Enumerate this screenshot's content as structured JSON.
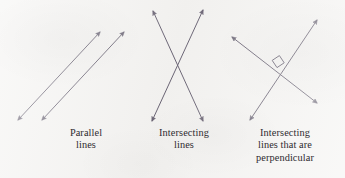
{
  "figure": {
    "background_color": "#f4f3f1",
    "stroke_color": "#6b6575",
    "text_color": "#2e2b30",
    "stroke_width": 1.0
  },
  "diagrams": [
    {
      "id": "parallel",
      "name": "parallel-lines",
      "caption": "Parallel\nlines",
      "caption_line1": "Parallel",
      "caption_line2": "lines",
      "arrow_style": "double-headed",
      "lines": [
        {
          "x1": 18,
          "y1": 120,
          "x2": 100,
          "y2": 32
        },
        {
          "x1": 42,
          "y1": 120,
          "x2": 124,
          "y2": 32
        }
      ],
      "has_right_angle_mark": false
    },
    {
      "id": "intersecting",
      "name": "intersecting-lines",
      "caption": "Intersecting\nlines",
      "caption_line1": "Intersecting",
      "caption_line2": "lines",
      "arrow_style": "double-headed",
      "lines": [
        {
          "x1": 153,
          "y1": 11,
          "x2": 203,
          "y2": 121
        },
        {
          "x1": 203,
          "y1": 10,
          "x2": 152,
          "y2": 121
        }
      ],
      "has_right_angle_mark": false
    },
    {
      "id": "perpendicular",
      "name": "perpendicular-intersecting-lines",
      "caption": "Intersecting\nlines that are\nperpendicular",
      "caption_line1": "Intersecting",
      "caption_line2": "lines that are",
      "caption_line3": "perpendicular",
      "arrow_style": "double-headed",
      "lines": [
        {
          "x1": 232,
          "y1": 37,
          "x2": 317,
          "y2": 103
        },
        {
          "x1": 250,
          "y1": 120,
          "x2": 317,
          "y2": 20
        }
      ],
      "has_right_angle_mark": true,
      "right_angle_mark": {
        "cx": 278,
        "cy": 64,
        "size": 9
      }
    }
  ]
}
